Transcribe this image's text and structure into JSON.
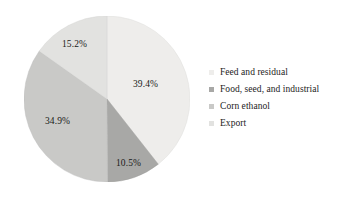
{
  "chart_data": {
    "type": "pie",
    "title": "",
    "categories": [
      "Feed and residual",
      "Food, seed, and industrial",
      "Corn ethanol",
      "Export"
    ],
    "values": [
      39.4,
      10.5,
      34.9,
      15.2
    ],
    "value_labels": [
      "39.4%",
      "10.5%",
      "34.9%",
      "15.2%"
    ],
    "colors": [
      "#eeedeb",
      "#a8a8a6",
      "#c9c9c7",
      "#e2e2e0"
    ],
    "start_angle_deg": 0,
    "direction": "clockwise",
    "units": "percent",
    "legend_position": "right",
    "grid": false
  },
  "legend": {
    "items": [
      {
        "label": "Feed and residual",
        "color": "#eeedeb"
      },
      {
        "label": "Food, seed, and industrial",
        "color": "#a8a8a6"
      },
      {
        "label": "Corn ethanol",
        "color": "#c9c9c7"
      },
      {
        "label": "Export",
        "color": "#e2e2e0"
      }
    ]
  },
  "slice_labels": {
    "feed": "39.4%",
    "food": "10.5%",
    "ethanol": "34.9%",
    "export": "15.2%"
  }
}
